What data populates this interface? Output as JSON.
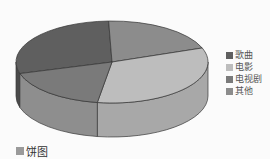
{
  "chart_data": {
    "type": "pie",
    "style": "3d",
    "title": "",
    "caption": "饼图",
    "categories": [
      "歌曲",
      "电影",
      "电视剧",
      "其他"
    ],
    "values": [
      29,
      20,
      33,
      18
    ],
    "colors": [
      "#5f5f5f",
      "#8c8c8c",
      "#bdbdbd",
      "#7a7a7a"
    ],
    "side_colors": [
      "#4a4a4a",
      "#6e6e6e",
      "#a8a8a8",
      "#8e8e8e"
    ],
    "legend_position": "right"
  },
  "legend": {
    "items": [
      {
        "label": "歌曲",
        "color": "#5f5f5f"
      },
      {
        "label": "电影",
        "color": "#bdbdbd"
      },
      {
        "label": "电视剧",
        "color": "#7a7a7a"
      },
      {
        "label": "其他",
        "color": "#8c8c8c"
      }
    ]
  },
  "caption": {
    "label": "饼图"
  }
}
